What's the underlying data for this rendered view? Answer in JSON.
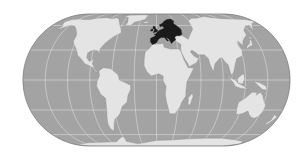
{
  "map": {
    "projection": "Eckert IV / pseudo-cylindrical world",
    "highlighted_region": "Europe",
    "colors": {
      "background": "#ffffff",
      "ocean": "#a3a3a3",
      "land": "#e4e4e4",
      "highlight": "#1a1a1a",
      "graticule": "#d6d6d6",
      "coast": "#8a8a8a",
      "outline": "#7a7a7a"
    },
    "graticule": {
      "latitudes": [
        -60,
        -30,
        0,
        30,
        60
      ],
      "longitudes": [
        -150,
        -120,
        -90,
        -60,
        -30,
        0,
        30,
        60,
        90,
        120,
        150
      ]
    },
    "landmasses": [
      {
        "name": "North America",
        "highlighted": false
      },
      {
        "name": "Greenland",
        "highlighted": false
      },
      {
        "name": "South America",
        "highlighted": false
      },
      {
        "name": "Africa",
        "highlighted": false
      },
      {
        "name": "Europe",
        "highlighted": true
      },
      {
        "name": "Asia",
        "highlighted": false
      },
      {
        "name": "Australia",
        "highlighted": false
      },
      {
        "name": "Antarctica",
        "highlighted": false
      },
      {
        "name": "Madagascar",
        "highlighted": false
      },
      {
        "name": "Japan",
        "highlighted": false
      },
      {
        "name": "Indonesia",
        "highlighted": false
      },
      {
        "name": "New Zealand",
        "highlighted": false
      },
      {
        "name": "British Isles",
        "highlighted": true
      },
      {
        "name": "Iceland",
        "highlighted": false
      }
    ]
  }
}
